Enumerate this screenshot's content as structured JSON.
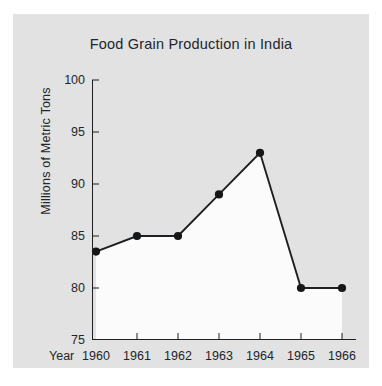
{
  "chart_data": {
    "type": "line",
    "title": "Food Grain Production in India",
    "xlabel": "Year",
    "ylabel": "Millions of Metric Tons",
    "categories": [
      "1960",
      "1961",
      "1962",
      "1963",
      "1964",
      "1965",
      "1966"
    ],
    "values": [
      83.5,
      85,
      85,
      89,
      93,
      80,
      80
    ],
    "series": [
      {
        "name": "Food Grain Production",
        "values": [
          83.5,
          85,
          85,
          89,
          93,
          80,
          80
        ]
      }
    ],
    "ylim": [
      75,
      100
    ],
    "yticks": [
      75,
      80,
      85,
      90,
      95,
      100
    ],
    "ytick_labels": [
      "75",
      "80",
      "85",
      "90",
      "95",
      "100"
    ],
    "xtick_labels": [
      "1960",
      "1961",
      "1962",
      "1963",
      "1964",
      "1965",
      "1966"
    ],
    "grid": false,
    "legend": false,
    "legend_position": "none",
    "fill_under": true,
    "markers": "circle",
    "colors": {
      "figure_background": "#e2e2e2",
      "page_background": "#ffffff",
      "plot_fill": "#fbfbfb",
      "line": "#1d1f22",
      "marker": "#141618",
      "axis": "#1d1f22",
      "text": "#22262b"
    }
  }
}
